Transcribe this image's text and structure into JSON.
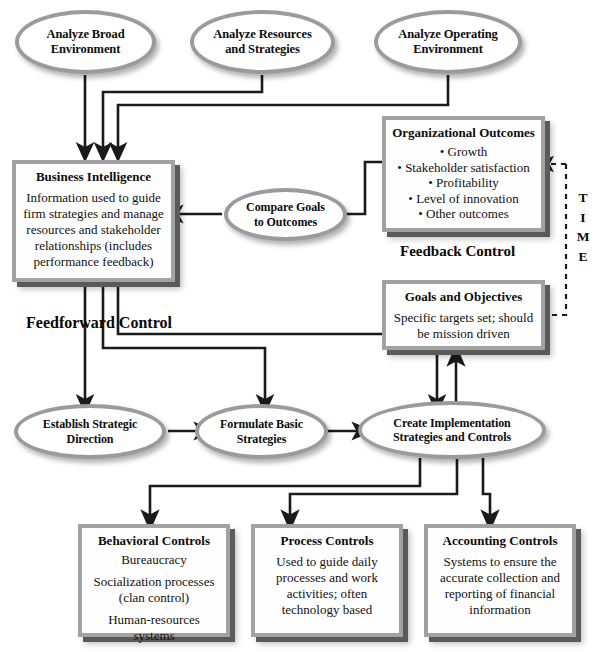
{
  "diagram": {
    "colors": {
      "node_border": "#9b9b9b",
      "box_border": "#a2a2a2",
      "shadow": "#5a5a5a",
      "line": "#1a1a1a",
      "background": "#ffffff",
      "text": "#0d0d0d"
    }
  },
  "nodes": {
    "analyze_broad": {
      "line1": "Analyze Broad",
      "line2": "Environment"
    },
    "analyze_resources": {
      "line1": "Analyze Resources",
      "line2": "and Strategies"
    },
    "analyze_operating": {
      "line1": "Analyze Operating",
      "line2": "Environment"
    },
    "compare_goals": {
      "line1": "Compare Goals",
      "line2": "to Outcomes"
    },
    "establish_direction": {
      "line1": "Establish Strategic",
      "line2": "Direction"
    },
    "formulate_strategies": {
      "line1": "Formulate Basic",
      "line2": "Strategies"
    },
    "create_implementation": {
      "line1": "Create Implementation",
      "line2": "Strategies and Controls"
    }
  },
  "boxes": {
    "business_intelligence": {
      "title": "Business Intelligence",
      "body": "Information used to guide firm strategies and manage resources and stakeholder relationships (includes performance feedback)"
    },
    "organizational_outcomes": {
      "title": "Organizational Outcomes",
      "bullets": [
        "Growth",
        "Stakeholder satisfaction",
        "Profitability",
        "Level of innovation",
        "Other outcomes"
      ]
    },
    "goals_objectives": {
      "title": "Goals and Objectives",
      "body": "Specific targets set; should be mission driven"
    },
    "behavioral_controls": {
      "title": "Behavioral Controls",
      "line1": "Bureaucracy",
      "line2": "Socialization processes (clan control)",
      "line3": "Human-resources systems"
    },
    "process_controls": {
      "title": "Process Controls",
      "body": "Used to guide daily processes and work activities; often technology based"
    },
    "accounting_controls": {
      "title": "Accounting Controls",
      "body": "Systems to ensure the accurate collection and reporting of financial information"
    }
  },
  "labels": {
    "feedforward_control": "Feedforward Control",
    "feedback_control": "Feedback Control",
    "time": [
      "T",
      "I",
      "M",
      "E"
    ]
  }
}
